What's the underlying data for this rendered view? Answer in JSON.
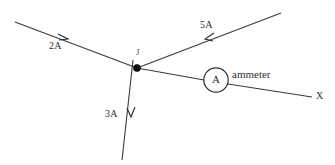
{
  "diagram": {
    "background_color": "#ffffff",
    "wire_color": "#3a3a3a",
    "node_color": "#0a0a0a",
    "junction": {
      "label": "J",
      "x": 137,
      "y": 68
    },
    "branches": [
      {
        "name": "upper-left-branch",
        "current_label": "2A",
        "current_value": 2,
        "unit": "A",
        "direction": "into-junction",
        "arrow_direction": "right-down"
      },
      {
        "name": "upper-right-branch",
        "current_label": "5A",
        "current_value": 5,
        "unit": "A",
        "direction": "into-junction",
        "arrow_direction": "left-down"
      },
      {
        "name": "lower-branch",
        "current_label": "3A",
        "current_value": 3,
        "unit": "A",
        "direction": "out-of-junction",
        "arrow_direction": "down"
      },
      {
        "name": "right-branch",
        "current_label": "",
        "current_value": null,
        "unit": "A",
        "direction": "out-of-junction",
        "arrow_direction": "none"
      }
    ],
    "components": [
      {
        "name": "ammeter",
        "symbol_letter": "A",
        "label": "ammeter",
        "shape": "circle"
      }
    ],
    "terminals": [
      {
        "name": "right-terminal",
        "label": "X"
      }
    ]
  }
}
